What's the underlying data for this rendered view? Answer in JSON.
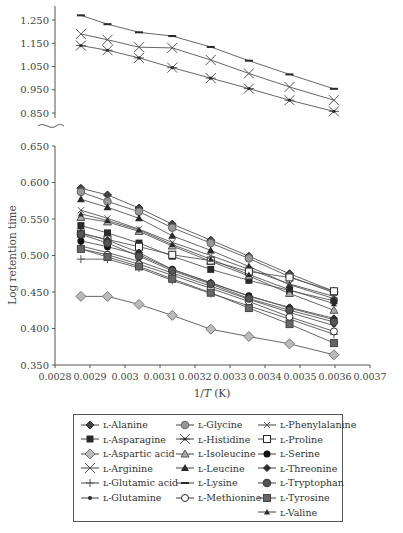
{
  "chart_data": {
    "type": "line",
    "title": "",
    "xlabel": "1/T (K)",
    "ylabel": "Log retention time",
    "x_ticks": [
      "0.0028",
      "0.0029",
      "0.003",
      "0.0031",
      "0.0032",
      "0.0033",
      "0.0034",
      "0.0035",
      "0.0036",
      "0.0037"
    ],
    "xlim": [
      0.0028,
      0.0037
    ],
    "panels": [
      {
        "name": "upper",
        "ylim": [
          0.82,
          1.28
        ],
        "y_ticks": [
          "0.850",
          "0.950",
          "1.050",
          "1.150",
          "1.250"
        ]
      },
      {
        "name": "lower",
        "ylim": [
          0.35,
          0.65
        ],
        "y_ticks": [
          "0.350",
          "0.400",
          "0.450",
          "0.500",
          "0.550",
          "0.600",
          "0.650"
        ]
      }
    ],
    "axis_break": true,
    "grid": false,
    "legend_position": "bottom",
    "x": [
      0.002874,
      0.00295,
      0.00304,
      0.003135,
      0.003245,
      0.003354,
      0.00347,
      0.003597
    ],
    "series": [
      {
        "name": "L-Alanine",
        "marker": "diamond-filled",
        "panel": "lower",
        "values": [
          0.592,
          0.583,
          0.565,
          0.543,
          0.521,
          0.499,
          0.475,
          0.451
        ]
      },
      {
        "name": "L-Asparagine",
        "marker": "square-filled",
        "panel": "lower",
        "values": [
          0.541,
          0.531,
          0.517,
          0.499,
          0.481,
          0.466,
          0.452,
          0.438
        ]
      },
      {
        "name": "L-Aspartic acid",
        "marker": "diamond-gray",
        "panel": "lower",
        "values": [
          0.444,
          0.444,
          0.433,
          0.418,
          0.399,
          0.389,
          0.379,
          0.364
        ]
      },
      {
        "name": "L-Arginine",
        "marker": "x",
        "panel": "upper",
        "values": [
          1.19,
          1.165,
          1.133,
          1.13,
          1.078,
          1.02,
          0.962,
          0.905
        ]
      },
      {
        "name": "L-Glutamic acid",
        "marker": "plus",
        "panel": "lower",
        "values": [
          0.495,
          0.495,
          0.483,
          0.466,
          0.448,
          0.431,
          0.413,
          0.392
        ]
      },
      {
        "name": "L-Glutamine",
        "marker": "dot",
        "panel": "lower",
        "values": [
          0.513,
          0.504,
          0.492,
          0.476,
          0.458,
          0.44,
          0.422,
          0.404
        ]
      },
      {
        "name": "L-Glycine",
        "marker": "circle-gray",
        "panel": "lower",
        "values": [
          0.587,
          0.574,
          0.56,
          0.538,
          0.517,
          0.496,
          0.471,
          0.449
        ]
      },
      {
        "name": "L-Histidine",
        "marker": "asterisk",
        "panel": "upper",
        "values": [
          1.14,
          1.12,
          1.087,
          1.045,
          1.0,
          0.955,
          0.905,
          0.857
        ]
      },
      {
        "name": "L-Isoleucine",
        "marker": "triangle-gray",
        "panel": "lower",
        "values": [
          0.552,
          0.546,
          0.533,
          0.513,
          0.492,
          0.472,
          0.448,
          0.425
        ]
      },
      {
        "name": "L-Leucine",
        "marker": "triangle-filled",
        "panel": "lower",
        "values": [
          0.577,
          0.566,
          0.551,
          0.527,
          0.507,
          0.485,
          0.46,
          0.441
        ]
      },
      {
        "name": "L-Lysine",
        "marker": "dash",
        "panel": "upper",
        "values": [
          1.27,
          1.232,
          1.197,
          1.181,
          1.134,
          1.075,
          1.016,
          0.954
        ]
      },
      {
        "name": "L-Methionine",
        "marker": "circle-open",
        "panel": "lower",
        "values": [
          0.509,
          0.501,
          0.488,
          0.473,
          0.455,
          0.437,
          0.416,
          0.396
        ]
      },
      {
        "name": "L-Phenylalanine",
        "marker": "x-small",
        "panel": "lower",
        "values": [
          0.562,
          0.551,
          0.536,
          0.518,
          0.5,
          0.481,
          0.461,
          0.444
        ]
      },
      {
        "name": "L-Proline",
        "marker": "square-open",
        "panel": "lower",
        "values": [
          0.53,
          0.522,
          0.512,
          0.501,
          0.493,
          0.478,
          0.47,
          0.451
        ]
      },
      {
        "name": "L-Serine",
        "marker": "circle-filled",
        "panel": "lower",
        "values": [
          0.52,
          0.512,
          0.501,
          0.481,
          0.462,
          0.445,
          0.428,
          0.412
        ]
      },
      {
        "name": "L-Threonine",
        "marker": "diamond-small",
        "panel": "lower",
        "values": [
          0.531,
          0.521,
          0.504,
          0.481,
          0.463,
          0.444,
          0.429,
          0.414
        ]
      },
      {
        "name": "L-Tryptophan",
        "marker": "circle-dark",
        "panel": "lower",
        "values": [
          0.529,
          0.517,
          0.499,
          0.479,
          0.461,
          0.441,
          0.425,
          0.409
        ]
      },
      {
        "name": "L-Tyrosine",
        "marker": "square-gray",
        "panel": "lower",
        "values": [
          0.509,
          0.498,
          0.485,
          0.468,
          0.449,
          0.428,
          0.406,
          0.38
        ]
      },
      {
        "name": "L-Valine",
        "marker": "triangle-small",
        "panel": "lower",
        "values": [
          0.557,
          0.548,
          0.535,
          0.515,
          0.495,
          0.474,
          0.453,
          0.434
        ]
      }
    ]
  },
  "legend": {
    "col1": [
      "L-Alanine",
      "L-Asparagine",
      "L-Aspartic acid",
      "L-Arginine",
      "L-Glutamic acid",
      "L-Glutamine"
    ],
    "col2": [
      "L-Glycine",
      "L-Histidine",
      "L-Isoleucine",
      "L-Leucine",
      "L-Lysine",
      "L-Methionine"
    ],
    "col3": [
      "L-Phenylalanine",
      "L-Proline",
      "L-Serine",
      "L-Threonine",
      "L-Tryptophan",
      "L-Tyrosine",
      "L-Valine"
    ]
  },
  "axes": {
    "xlabel_prefix": "1/",
    "xlabel_var": "T",
    "xlabel_unit": " (K)",
    "ylabel": "Log retention time"
  }
}
